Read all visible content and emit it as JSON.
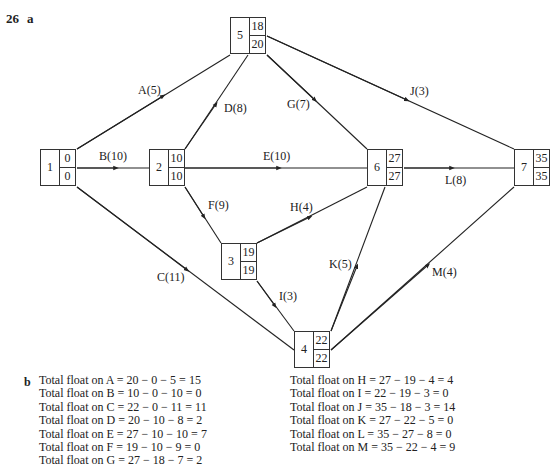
{
  "header": {
    "question_number": "26",
    "part_a": "a",
    "part_b": "b"
  },
  "nodes": [
    {
      "id": "1",
      "early": "0",
      "late": "0"
    },
    {
      "id": "2",
      "early": "10",
      "late": "10"
    },
    {
      "id": "3",
      "early": "19",
      "late": "19"
    },
    {
      "id": "4",
      "early": "22",
      "late": "22"
    },
    {
      "id": "5",
      "early": "18",
      "late": "20"
    },
    {
      "id": "6",
      "early": "27",
      "late": "27"
    },
    {
      "id": "7",
      "early": "35",
      "late": "35"
    }
  ],
  "activities": [
    {
      "label": "A(5)",
      "from": "1",
      "to": "5"
    },
    {
      "label": "B(10)",
      "from": "1",
      "to": "2"
    },
    {
      "label": "C(11)",
      "from": "1",
      "to": "4"
    },
    {
      "label": "D(8)",
      "from": "2",
      "to": "5"
    },
    {
      "label": "E(10)",
      "from": "2",
      "to": "6"
    },
    {
      "label": "F(9)",
      "from": "2",
      "to": "3"
    },
    {
      "label": "G(7)",
      "from": "5",
      "to": "6"
    },
    {
      "label": "H(4)",
      "from": "3",
      "to": "6"
    },
    {
      "label": "I(3)",
      "from": "3",
      "to": "4"
    },
    {
      "label": "J(3)",
      "from": "5",
      "to": "7"
    },
    {
      "label": "K(5)",
      "from": "4",
      "to": "6"
    },
    {
      "label": "L(8)",
      "from": "6",
      "to": "7"
    },
    {
      "label": "M(4)",
      "from": "4",
      "to": "7"
    }
  ],
  "total_float_left": [
    "Total float on A = 20 − 0 − 5 = 15",
    "Total float on B = 10 − 0 − 10 = 0",
    "Total float on C = 22 − 0 − 11 = 11",
    "Total float on D = 20 − 10 − 8 = 2",
    "Total float on E = 27 − 10 − 10 = 7",
    "Total float on F = 19 − 10 − 9 = 0",
    "Total float on G = 27 − 18 − 7 = 2"
  ],
  "total_float_right": [
    "Total float on H = 27 − 19 − 4 = 4",
    "Total float on I = 22 − 19 − 3 = 0",
    "Total float on J = 35 − 18 − 3 = 14",
    "Total float on K = 27 − 22 − 5 = 0",
    "Total float on L = 35 − 27 − 8 = 0",
    "Total float on M = 35 − 22 − 4 = 9"
  ]
}
